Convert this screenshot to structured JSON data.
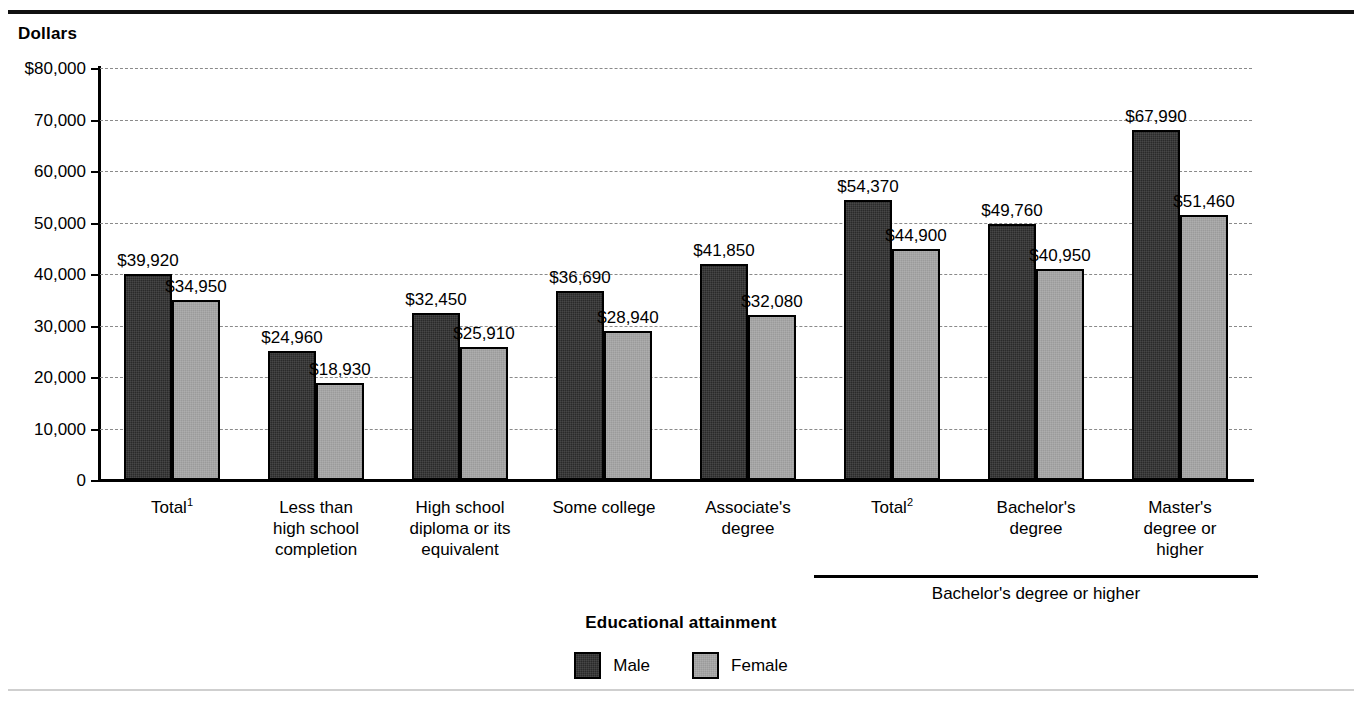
{
  "top_ghost_text": "",
  "y_axis_title": "Dollars",
  "x_axis_title": "Educational attainment",
  "group_bracket": {
    "label": "Bachelor's degree or higher",
    "start_category_index": 5,
    "end_category_index": 7
  },
  "legend": {
    "position": "bottom-center",
    "items": [
      {
        "label": "Male",
        "color": "#2a2a2a",
        "swatch": "dark-square-swatch"
      },
      {
        "label": "Female",
        "color": "#9b9b9b",
        "swatch": "gray-square-swatch"
      }
    ]
  },
  "footnote_markers": {
    "total_1": "1",
    "total_2": "2"
  },
  "chart_data": {
    "type": "bar",
    "title": "",
    "subtitle": "",
    "xlabel": "Educational attainment",
    "ylabel": "Dollars",
    "ylim": [
      0,
      80000
    ],
    "ytick_values": [
      0,
      10000,
      20000,
      30000,
      40000,
      50000,
      60000,
      70000,
      80000
    ],
    "ytick_labels": [
      "0",
      "10,000",
      "20,000",
      "30,000",
      "40,000",
      "50,000",
      "60,000",
      "70,000",
      "$80,000"
    ],
    "grid": true,
    "grid_style": "dashed-horizontal",
    "legend_position": "bottom-center",
    "categories": [
      "Total¹",
      "Less than\nhigh school\ncompletion",
      "High school\ndiploma or its\nequivalent",
      "Some college",
      "Associate's\ndegree",
      "Total²",
      "Bachelor's\ndegree",
      "Master's\ndegree or\nhigher"
    ],
    "series": [
      {
        "name": "Male",
        "color": "#2a2a2a",
        "values": [
          39920,
          24960,
          32450,
          36690,
          41850,
          54370,
          49760,
          67990
        ],
        "labels": [
          "$39,920",
          "$24,960",
          "$32,450",
          "$36,690",
          "$41,850",
          "$54,370",
          "$49,760",
          "$67,990"
        ]
      },
      {
        "name": "Female",
        "color": "#9b9b9b",
        "values": [
          34950,
          18930,
          25910,
          28940,
          32080,
          44900,
          40950,
          51460
        ],
        "labels": [
          "$34,950",
          "$18,930",
          "$25,910",
          "$28,940",
          "$32,080",
          "$44,900",
          "$40,950",
          "$51,460"
        ]
      }
    ],
    "annotations": [
      {
        "text": "Bachelor's degree or higher",
        "type": "group-bracket",
        "spans": [
          "Total²",
          "Bachelor's degree",
          "Master's degree or higher"
        ]
      }
    ]
  }
}
